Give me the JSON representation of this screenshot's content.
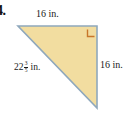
{
  "problem": {
    "number": "4."
  },
  "figure": {
    "shape_name": "right-triangle",
    "fill_color": "#F2DDA0",
    "stroke_color": "#8FA8BC",
    "right_angle_color": "#C8762A",
    "vertices": {
      "top_left": [
        18,
        26
      ],
      "top_right": [
        97,
        26
      ],
      "bottom_right": [
        97,
        108
      ]
    }
  },
  "labels": {
    "top": {
      "text": "16 in.",
      "value": "16",
      "unit": "in."
    },
    "right": {
      "text": "16 in.",
      "value": "16",
      "unit": "in."
    },
    "hypotenuse": {
      "whole": "22",
      "numerator": "3",
      "denominator": "5",
      "unit": "in.",
      "text": "22 3/5 in."
    }
  }
}
